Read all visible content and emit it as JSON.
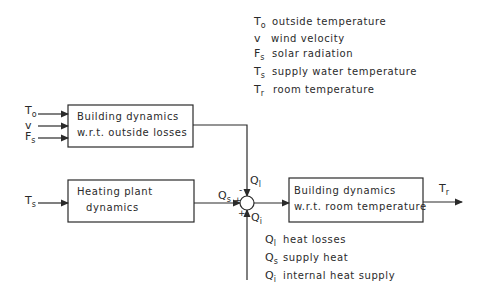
{
  "legend_top": [
    {
      "symbol": "T",
      "sub": "o",
      "text": "outside temperature"
    },
    {
      "symbol": "v",
      "sub": "",
      "text": "wind velocity"
    },
    {
      "symbol": "F",
      "sub": "s",
      "text": "solar radiation"
    },
    {
      "symbol": "T",
      "sub": "s",
      "text": "supply water temperature"
    },
    {
      "symbol": "T",
      "sub": "r",
      "text": "room temperature"
    }
  ],
  "legend_bottom": [
    {
      "symbol": "Q",
      "sub": "l",
      "text": "heat losses"
    },
    {
      "symbol": "Q",
      "sub": "s",
      "text": "supply heat"
    },
    {
      "symbol": "Q",
      "sub": "i",
      "text": "internal heat supply"
    }
  ],
  "blocks": {
    "outside": {
      "line1": "Building dynamics",
      "line2": "w.r.t. outside losses"
    },
    "plant": {
      "line1": "Heating plant",
      "line2": "dynamics"
    },
    "room": {
      "line1": "Building dynamics",
      "line2": "w.r.t. room temperature"
    }
  },
  "inputs": {
    "to": {
      "symbol": "T",
      "sub": "o"
    },
    "v": {
      "symbol": "v",
      "sub": ""
    },
    "fs": {
      "symbol": "F",
      "sub": "s"
    },
    "ts": {
      "symbol": "T",
      "sub": "s"
    }
  },
  "signals": {
    "qs": {
      "symbol": "Q",
      "sub": "s"
    },
    "ql": {
      "symbol": "Q",
      "sub": "l"
    },
    "qi": {
      "symbol": "Q",
      "sub": "i"
    },
    "tr": {
      "symbol": "T",
      "sub": "r"
    }
  },
  "junction_signs": {
    "top": "-",
    "left": "+",
    "bottom": "+"
  }
}
